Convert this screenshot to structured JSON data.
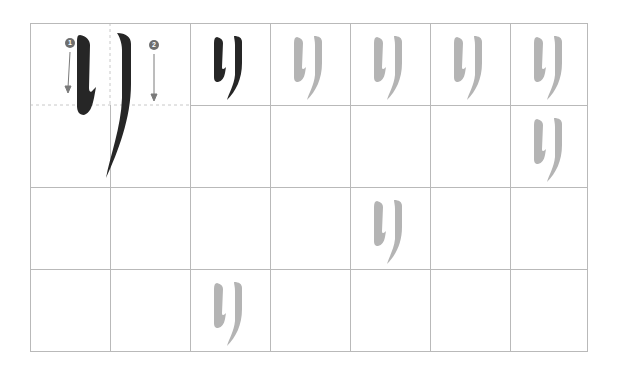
{
  "worksheet": {
    "character": "り",
    "character_name": "ri",
    "stroke_count": 2,
    "grid": {
      "columns": 7,
      "rows": 4,
      "left": 30,
      "top": 23,
      "col_width": 80,
      "row_height": 82
    },
    "colors": {
      "grid_line": "#b9b9b9",
      "guide_line": "#c8c8c8",
      "model_stroke": "#262626",
      "trace_stroke": "#b4b4b4",
      "badge": "#6e6e6e",
      "arrow": "#7a7a7a"
    },
    "model": {
      "span": "columns 1-2, row 1",
      "strokes": [
        {
          "number": "1",
          "direction": "down"
        },
        {
          "number": "2",
          "direction": "down"
        }
      ]
    },
    "samples": [
      {
        "row": 1,
        "col": 3,
        "style": "solid",
        "char": "り"
      },
      {
        "row": 1,
        "col": 4,
        "style": "trace",
        "char": "り"
      },
      {
        "row": 1,
        "col": 5,
        "style": "trace",
        "char": "り"
      },
      {
        "row": 1,
        "col": 6,
        "style": "trace",
        "char": "り"
      },
      {
        "row": 1,
        "col": 7,
        "style": "trace",
        "char": "り"
      },
      {
        "row": 2,
        "col": 7,
        "style": "trace",
        "char": "り"
      },
      {
        "row": 3,
        "col": 5,
        "style": "trace",
        "char": "り"
      },
      {
        "row": 4,
        "col": 3,
        "style": "trace",
        "char": "り"
      }
    ]
  }
}
